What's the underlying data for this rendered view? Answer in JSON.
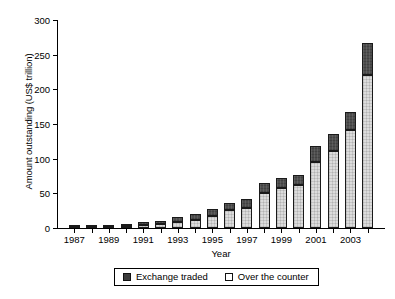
{
  "chart_data": {
    "type": "bar",
    "subtype": "stacked-vertical",
    "title": "",
    "xlabel": "Year",
    "ylabel": "Amount outstanding (US$ trillion)",
    "ylim": [
      0,
      300
    ],
    "yticks": [
      0,
      50,
      100,
      150,
      200,
      250,
      300
    ],
    "ytick_labels": [
      "0",
      "50",
      "100",
      "150",
      "200",
      "250",
      "300"
    ],
    "grid": false,
    "legend_position": "below-axes",
    "categories": [
      "1987",
      "1988",
      "1989",
      "1990",
      "1991",
      "1992",
      "1993",
      "1994",
      "1995",
      "1996",
      "1997",
      "1998",
      "1999",
      "2000",
      "2001",
      "2002",
      "2003",
      "2004"
    ],
    "xtick_labels_shown": [
      "1987",
      "",
      "1989",
      "",
      "1991",
      "",
      "1993",
      "",
      "1995",
      "",
      "1997",
      "",
      "1999",
      "",
      "2001",
      "",
      "2003",
      ""
    ],
    "series": [
      {
        "name": "Over the counter",
        "fill": "light",
        "color": "#dcdcdc",
        "values": [
          0.5,
          1.2,
          1.6,
          3.5,
          4.5,
          5.3,
          8.5,
          11.3,
          17.7,
          25.5,
          29.0,
          50.0,
          58.3,
          62.0,
          95.2,
          111.2,
          141.7,
          220.1
        ]
      },
      {
        "name": "Exchange traded",
        "fill": "dark",
        "color": "#4d4d4d",
        "values": [
          0.7,
          1.3,
          1.8,
          2.3,
          3.5,
          4.6,
          7.8,
          8.9,
          9.3,
          10.0,
          12.4,
          14.3,
          13.5,
          14.3,
          23.8,
          23.9,
          25.4,
          46.6
        ]
      }
    ],
    "totals": [
      1.2,
      2.5,
      3.4,
      5.8,
      8.0,
      9.9,
      16.3,
      20.2,
      27.0,
      35.5,
      41.4,
      64.3,
      71.8,
      76.3,
      119.0,
      135.1,
      167.1,
      266.7
    ]
  },
  "legend": {
    "entries": [
      {
        "label": "Exchange traded",
        "swatch": "dark-square-icon"
      },
      {
        "label": "Over the counter",
        "swatch": "light-square-icon"
      }
    ]
  }
}
